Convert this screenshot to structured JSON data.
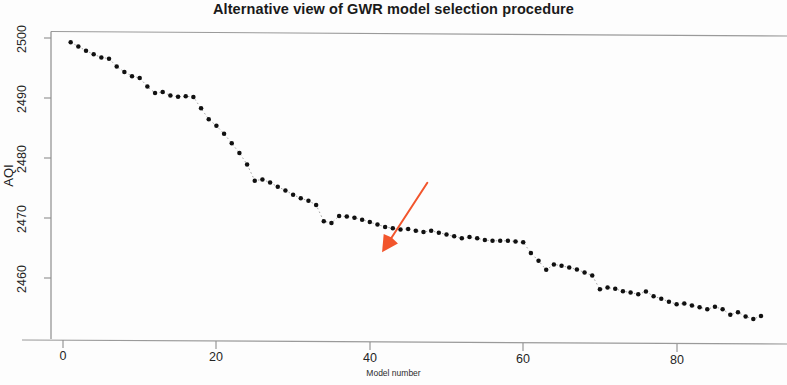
{
  "chart_data": {
    "type": "scatter",
    "title": "Alternative view of GWR model selection procedure",
    "xlabel": "Model number",
    "ylabel": "AQI",
    "xlim": [
      0,
      93
    ],
    "ylim": [
      2452,
      2502
    ],
    "xticks": [
      0,
      20,
      40,
      60,
      80
    ],
    "xtick_labels": [
      "0",
      "20",
      "40",
      "60",
      "80"
    ],
    "yticks": [
      2460,
      2470,
      2480,
      2490,
      2500
    ],
    "ytick_labels": [
      "2460",
      "2470",
      "2480",
      "2490",
      "2500"
    ],
    "grid": false,
    "legend": null,
    "marker": "filled-circle",
    "marker_color": "#111111",
    "connector": "dotted-line",
    "x": [
      1,
      2,
      3,
      4,
      5,
      6,
      7,
      8,
      9,
      10,
      11,
      12,
      13,
      14,
      15,
      16,
      17,
      18,
      19,
      20,
      21,
      22,
      23,
      24,
      25,
      26,
      27,
      28,
      29,
      30,
      31,
      32,
      33,
      34,
      35,
      36,
      37,
      38,
      39,
      40,
      41,
      42,
      43,
      44,
      45,
      46,
      47,
      48,
      49,
      50,
      51,
      52,
      53,
      54,
      55,
      56,
      57,
      58,
      59,
      60,
      61,
      62,
      63,
      64,
      65,
      66,
      67,
      68,
      69,
      70,
      71,
      72,
      73,
      74,
      75,
      76,
      77,
      78,
      79,
      80,
      81,
      82,
      83,
      84,
      85,
      86,
      87,
      88,
      89,
      90,
      91
    ],
    "y": [
      2499.3,
      2498.6,
      2497.9,
      2497.3,
      2496.8,
      2496.6,
      2495.3,
      2494.4,
      2493.7,
      2493.4,
      2492.0,
      2490.9,
      2491.1,
      2490.5,
      2490.3,
      2490.4,
      2490.3,
      2488.4,
      2486.6,
      2485.5,
      2484.2,
      2482.6,
      2481.0,
      2479.1,
      2476.4,
      2476.6,
      2476.1,
      2475.4,
      2474.8,
      2474.1,
      2473.5,
      2473.1,
      2472.4,
      2469.7,
      2469.4,
      2470.6,
      2470.5,
      2470.3,
      2470.0,
      2469.6,
      2469.2,
      2468.8,
      2468.6,
      2468.4,
      2468.5,
      2468.2,
      2468.0,
      2468.2,
      2467.9,
      2467.6,
      2467.3,
      2467.0,
      2467.2,
      2467.0,
      2466.7,
      2466.6,
      2466.6,
      2466.6,
      2466.5,
      2466.4,
      2464.6,
      2463.3,
      2461.8,
      2462.7,
      2462.5,
      2462.2,
      2461.9,
      2461.4,
      2460.9,
      2458.6,
      2458.9,
      2458.7,
      2458.3,
      2458.1,
      2457.8,
      2458.3,
      2457.5,
      2457.1,
      2456.6,
      2456.2,
      2456.3,
      2456.0,
      2455.7,
      2455.4,
      2455.8,
      2455.4,
      2454.5,
      2454.9,
      2454.2,
      2453.8,
      2454.3
    ],
    "annotations": [
      {
        "name": "highlight-arrow",
        "type": "arrow",
        "color": "#F2552C",
        "from_x": 47.5,
        "from_y": 2476.2,
        "to_x": 41.6,
        "to_y": 2464.6
      }
    ]
  }
}
